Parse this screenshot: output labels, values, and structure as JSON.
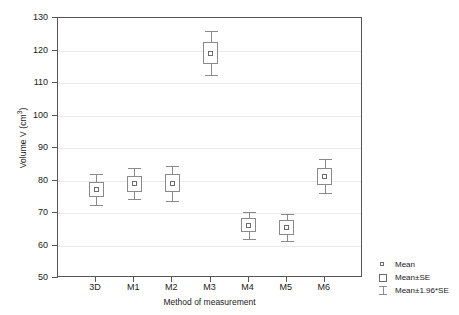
{
  "chart_data": {
    "type": "scatter",
    "title": "",
    "xlabel": "Method of measurement",
    "ylabel": "Volume V (cm3)",
    "ylabel_base": "Volume V (cm",
    "ylabel_sup": "3",
    "ylabel_tail": ")",
    "ylim": [
      50,
      130
    ],
    "yticks": [
      50,
      60,
      70,
      80,
      90,
      100,
      110,
      120,
      130
    ],
    "ytick_labels": [
      "50",
      "60",
      "70",
      "80",
      "90",
      "100",
      "110",
      "120",
      "130"
    ],
    "grid": true,
    "categories": [
      "3D",
      "M1",
      "M2",
      "M3",
      "M4",
      "M5",
      "M6"
    ],
    "series": [
      {
        "name": "Mean",
        "values": [
          77.2,
          79.0,
          79.2,
          119.2,
          66.2,
          65.5,
          81.3
        ]
      },
      {
        "name": "Mean±SE",
        "lower": [
          74.8,
          76.5,
          76.4,
          115.8,
          64.0,
          63.3,
          78.6
        ],
        "upper": [
          79.6,
          81.5,
          82.0,
          122.6,
          68.4,
          67.7,
          84.0
        ]
      },
      {
        "name": "Mean±1.96*SE",
        "lower": [
          72.5,
          74.2,
          73.8,
          112.5,
          62.0,
          61.3,
          76.1
        ],
        "upper": [
          81.9,
          83.8,
          84.6,
          125.9,
          70.4,
          69.7,
          86.5
        ]
      }
    ],
    "legend": {
      "position": "right",
      "entries": [
        {
          "label": "Mean",
          "marker": "small-square"
        },
        {
          "label": "Mean±SE",
          "marker": "box"
        },
        {
          "label": "Mean±1.96*SE",
          "marker": "whisker"
        }
      ]
    },
    "colors": {
      "axis": "#555555",
      "grid": "#e9e9e9",
      "marker_edge": "#6b6b6b",
      "whisker": "#8a8a8a",
      "background": "#ffffff"
    }
  }
}
